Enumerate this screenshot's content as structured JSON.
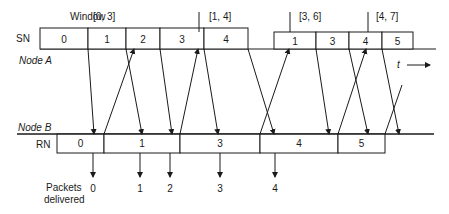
{
  "labels": {
    "window": "Window",
    "sn": "SN",
    "node_a": "Node A",
    "node_b": "Node B",
    "rn": "RN",
    "packets": "Packets",
    "delivered": "delivered",
    "time": "t"
  },
  "colors": {
    "ink": "#1a1a1a",
    "background": "#ffffff"
  },
  "node_a": {
    "line_y": 49,
    "line_x": [
      40,
      436
    ],
    "box_top_first": 28,
    "box_top_second": 32,
    "sn_segments_first": [
      {
        "x0": 40,
        "x1": 88,
        "label": "0"
      },
      {
        "x0": 88,
        "x1": 126,
        "label": "1"
      },
      {
        "x0": 126,
        "x1": 160,
        "label": "2"
      },
      {
        "x0": 160,
        "x1": 204,
        "label": "3"
      },
      {
        "x0": 204,
        "x1": 248,
        "label": "4"
      }
    ],
    "sn_segments_second": [
      {
        "x0": 274,
        "x1": 316,
        "label": "1"
      },
      {
        "x0": 316,
        "x1": 349,
        "label": "3"
      },
      {
        "x0": 349,
        "x1": 382,
        "label": "4"
      },
      {
        "x0": 382,
        "x1": 413,
        "label": "5"
      }
    ],
    "windows": [
      {
        "label": "[0, 3]",
        "tick_x": null,
        "text_x": 93
      },
      {
        "label": "[1, 4]",
        "tick_x": 199,
        "text_x": 209
      },
      {
        "label": "[3, 6]",
        "tick_x": 290,
        "text_x": 299
      },
      {
        "label": "[4, 7]",
        "tick_x": 368,
        "text_x": 376
      }
    ]
  },
  "node_b": {
    "line_y": 134,
    "line_x": [
      57,
      434
    ],
    "box_bottom": 153,
    "rn_segments": [
      {
        "x0": 57,
        "x1": 104,
        "label": "0"
      },
      {
        "x0": 104,
        "x1": 180,
        "label": "1"
      },
      {
        "x0": 180,
        "x1": 260,
        "label": "3"
      },
      {
        "x0": 260,
        "x1": 338,
        "label": "4"
      },
      {
        "x0": 338,
        "x1": 385,
        "label": "5"
      }
    ]
  },
  "data_packets": [
    {
      "from_x": 88,
      "to_x": 94
    },
    {
      "from_x": 126,
      "to_x": 142
    },
    {
      "from_x": 160,
      "to_x": 172
    },
    {
      "from_x": 204,
      "to_x": 218
    },
    {
      "from_x": 248,
      "to_x": 274
    },
    {
      "from_x": 316,
      "to_x": 329
    },
    {
      "from_x": 349,
      "to_x": 368
    },
    {
      "from_x": 382,
      "to_x": 399
    }
  ],
  "acks": [
    {
      "from_x": 104,
      "to_x": 134,
      "to_y": 49,
      "arrow": true
    },
    {
      "from_x": 180,
      "to_x": 198,
      "to_y": 49,
      "arrow": true
    },
    {
      "from_x": 260,
      "to_x": 289,
      "to_y": 49,
      "arrow": true
    },
    {
      "from_x": 338,
      "to_x": 366,
      "to_y": 49,
      "arrow": true
    },
    {
      "from_x": 385,
      "to_x": 402,
      "to_y": 85,
      "arrow": false
    }
  ],
  "delivered": [
    {
      "x": 93,
      "label": "0"
    },
    {
      "x": 140,
      "label": "1"
    },
    {
      "x": 170,
      "label": "2"
    },
    {
      "x": 220,
      "label": "3"
    },
    {
      "x": 275,
      "label": "4"
    }
  ]
}
